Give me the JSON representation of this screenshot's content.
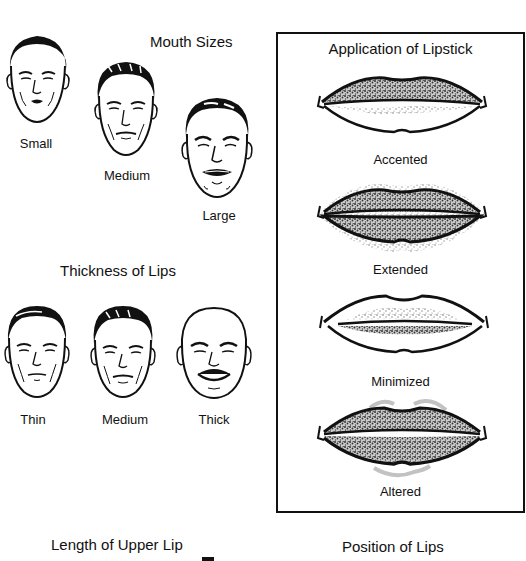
{
  "mouth_sizes": {
    "title": "Mouth Sizes",
    "faces": [
      {
        "label": "Small",
        "hair": "dark-wavy",
        "mouth": "small"
      },
      {
        "label": "Medium",
        "hair": "dark-curly",
        "mouth": "medium"
      },
      {
        "label": "Large",
        "hair": "dark-slick",
        "mouth": "large"
      }
    ]
  },
  "thickness_of_lips": {
    "title": "Thickness of Lips",
    "faces": [
      {
        "label": "Thin",
        "hair": "dark-wavy",
        "mouth": "thin"
      },
      {
        "label": "Medium",
        "hair": "dark-curly",
        "mouth": "medium"
      },
      {
        "label": "Thick",
        "hair": "bald",
        "mouth": "thick"
      }
    ]
  },
  "application_of_lipstick": {
    "title": "Application of Lipstick",
    "examples": [
      {
        "label": "Accented"
      },
      {
        "label": "Extended"
      },
      {
        "label": "Minimized"
      },
      {
        "label": "Altered"
      }
    ]
  },
  "length_of_upper_lip": {
    "title": "Length of Upper Lip"
  },
  "position_of_lips": {
    "title": "Position of Lips"
  },
  "colors": {
    "ink": "#111111",
    "background": "#ffffff",
    "stipple": "#555555"
  }
}
